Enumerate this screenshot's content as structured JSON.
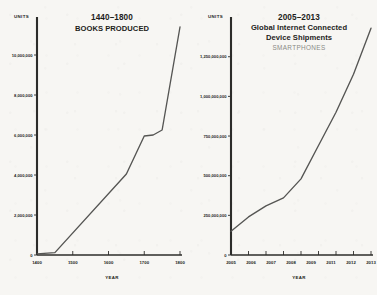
{
  "page": {
    "background_color": "#f7f6f3",
    "ink_color": "#1d1d1b",
    "line_color": "#555553",
    "subtitle_color": "#8a8a86"
  },
  "chart_data": [
    {
      "type": "line",
      "panel_id": "books-produced",
      "title": "1440–1800",
      "subtitle": "BOOKS PRODUCED",
      "subtitle_secondary": "",
      "xlabel": "YEAR",
      "ylabel": "UNITS",
      "grid": false,
      "legend": "none",
      "xlim": [
        1400,
        1800
      ],
      "ylim": [
        0,
        11500000
      ],
      "xticks": [
        1400,
        1500,
        1600,
        1700,
        1800
      ],
      "xtick_labels": [
        "1400",
        "1500",
        "1600",
        "1700",
        "1800"
      ],
      "yticks": [
        0,
        2000000,
        4000000,
        6000000,
        8000000,
        10000000
      ],
      "ytick_labels": [
        "0",
        "2,000,000",
        "4,000,000",
        "6,000,000",
        "8,000,000",
        "10,000,000"
      ],
      "x": [
        1400,
        1450,
        1650,
        1700,
        1725,
        1750,
        1800
      ],
      "values": [
        60000,
        120000,
        4050000,
        5950000,
        6000000,
        6250000,
        11400000
      ],
      "series": [
        {
          "name": "Books produced",
          "x": [
            1400,
            1450,
            1650,
            1700,
            1725,
            1750,
            1800
          ],
          "values": [
            60000,
            120000,
            4050000,
            5950000,
            6000000,
            6250000,
            11400000
          ]
        }
      ]
    },
    {
      "type": "line",
      "panel_id": "device-shipments",
      "title": "2005–2013",
      "subtitle": "Global Internet Connected",
      "subtitle_line2": "Device Shipments",
      "subtitle_secondary": "SMARTPHONES",
      "xlabel": "YEAR",
      "ylabel": "UNITS",
      "grid": false,
      "legend": "none",
      "xlim": [
        2005,
        2013
      ],
      "ylim": [
        0,
        1450000000
      ],
      "xticks": [
        2005,
        2006,
        2007,
        2008,
        2009,
        2010,
        2011,
        2012,
        2013
      ],
      "xtick_labels": [
        "2005",
        "2006",
        "2007",
        "2008",
        "2009",
        "2011",
        "2012",
        "2013"
      ],
      "yticks": [
        0,
        250000000,
        500000000,
        750000000,
        1000000000,
        1250000000
      ],
      "ytick_labels": [
        "0",
        "250,000,000",
        "500,000,000",
        "750,000,000",
        "1,000,000,000",
        "1,250,000,000"
      ],
      "x": [
        2005,
        2006,
        2007,
        2008,
        2009,
        2010,
        2011,
        2012,
        2013
      ],
      "values": [
        150000000,
        240000000,
        310000000,
        360000000,
        480000000,
        690000000,
        900000000,
        1140000000,
        1430000000
      ],
      "series": [
        {
          "name": "Smartphone shipments",
          "x": [
            2005,
            2006,
            2007,
            2008,
            2009,
            2010,
            2011,
            2012,
            2013
          ],
          "values": [
            150000000,
            240000000,
            310000000,
            360000000,
            480000000,
            690000000,
            900000000,
            1140000000,
            1430000000
          ]
        }
      ]
    }
  ]
}
